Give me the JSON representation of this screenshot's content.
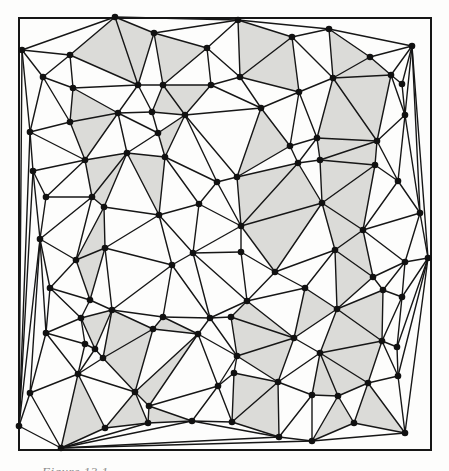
{
  "figure": {
    "caption": "Figure 13.1",
    "colors": {
      "background": "#fdfdfc",
      "line": "#161616",
      "dot": "#111111",
      "shade": "#dbdbd8",
      "frame": "#161616"
    },
    "frame": {
      "x": 19,
      "y": 18,
      "width": 412,
      "height": 432
    },
    "dot_radius": 3.3,
    "line_width": 1.4,
    "frame_width": 2,
    "points": [
      [
        115,
        17
      ],
      [
        238,
        20
      ],
      [
        329,
        29
      ],
      [
        412,
        46
      ],
      [
        292,
        37
      ],
      [
        154,
        33
      ],
      [
        207,
        48
      ],
      [
        22,
        50
      ],
      [
        70,
        55
      ],
      [
        370,
        57
      ],
      [
        391,
        75
      ],
      [
        402,
        84
      ],
      [
        43,
        77
      ],
      [
        73,
        88
      ],
      [
        138,
        85
      ],
      [
        163,
        85
      ],
      [
        211,
        85
      ],
      [
        240,
        77
      ],
      [
        299,
        92
      ],
      [
        333,
        78
      ],
      [
        405,
        115
      ],
      [
        118,
        113
      ],
      [
        185,
        115
      ],
      [
        152,
        112
      ],
      [
        70,
        122
      ],
      [
        127,
        153
      ],
      [
        317,
        138
      ],
      [
        377,
        141
      ],
      [
        30,
        132
      ],
      [
        33,
        171
      ],
      [
        85,
        160
      ],
      [
        165,
        157
      ],
      [
        375,
        165
      ],
      [
        320,
        160
      ],
      [
        46,
        197
      ],
      [
        92,
        197
      ],
      [
        104,
        207
      ],
      [
        217,
        182
      ],
      [
        237,
        177
      ],
      [
        298,
        163
      ],
      [
        398,
        181
      ],
      [
        322,
        203
      ],
      [
        420,
        213
      ],
      [
        199,
        204
      ],
      [
        159,
        215
      ],
      [
        40,
        239
      ],
      [
        105,
        248
      ],
      [
        76,
        260
      ],
      [
        193,
        253
      ],
      [
        241,
        226
      ],
      [
        363,
        230
      ],
      [
        335,
        250
      ],
      [
        405,
        262
      ],
      [
        428,
        258
      ],
      [
        172,
        265
      ],
      [
        241,
        252
      ],
      [
        275,
        272
      ],
      [
        50,
        288
      ],
      [
        90,
        300
      ],
      [
        305,
        288
      ],
      [
        373,
        277
      ],
      [
        383,
        290
      ],
      [
        402,
        297
      ],
      [
        81,
        318
      ],
      [
        112,
        310
      ],
      [
        46,
        333
      ],
      [
        85,
        344
      ],
      [
        95,
        349
      ],
      [
        103,
        358
      ],
      [
        78,
        374
      ],
      [
        30,
        393
      ],
      [
        153,
        329
      ],
      [
        163,
        317
      ],
      [
        135,
        392
      ],
      [
        149,
        406
      ],
      [
        148,
        423
      ],
      [
        19,
        426
      ],
      [
        61,
        448
      ],
      [
        105,
        428
      ],
      [
        192,
        421
      ],
      [
        210,
        318
      ],
      [
        231,
        317
      ],
      [
        198,
        334
      ],
      [
        237,
        356
      ],
      [
        234,
        373
      ],
      [
        218,
        386
      ],
      [
        232,
        422
      ],
      [
        247,
        301
      ],
      [
        278,
        382
      ],
      [
        294,
        338
      ],
      [
        279,
        437
      ],
      [
        312,
        441
      ],
      [
        337,
        309
      ],
      [
        382,
        341
      ],
      [
        397,
        347
      ],
      [
        320,
        353
      ],
      [
        398,
        376
      ],
      [
        368,
        383
      ],
      [
        338,
        396
      ],
      [
        312,
        395
      ],
      [
        354,
        423
      ],
      [
        405,
        433
      ],
      [
        158,
        133
      ],
      [
        261,
        108
      ],
      [
        290,
        146
      ]
    ],
    "shaded_regions": [
      [
        108,
        50
      ],
      [
        136,
        45
      ],
      [
        87,
        108
      ],
      [
        105,
        129
      ],
      [
        175,
        55
      ],
      [
        257,
        45
      ],
      [
        264,
        74
      ],
      [
        186,
        95
      ],
      [
        167,
        104
      ],
      [
        171,
        134
      ],
      [
        265,
        130
      ],
      [
        344,
        55
      ],
      [
        365,
        70
      ],
      [
        367,
        98
      ],
      [
        342,
        119
      ],
      [
        350,
        150
      ],
      [
        337,
        155
      ],
      [
        102,
        171
      ],
      [
        109,
        186
      ],
      [
        100,
        220
      ],
      [
        92,
        270
      ],
      [
        258,
        189
      ],
      [
        270,
        200
      ],
      [
        272,
        250
      ],
      [
        152,
        192
      ],
      [
        339,
        176
      ],
      [
        353,
        199
      ],
      [
        340,
        228
      ],
      [
        357,
        252
      ],
      [
        350,
        278
      ],
      [
        93,
        324
      ],
      [
        100,
        337
      ],
      [
        124,
        332
      ],
      [
        131,
        360
      ],
      [
        143,
        412
      ],
      [
        171,
        327
      ],
      [
        180,
        360
      ],
      [
        267,
        318
      ],
      [
        254,
        337
      ],
      [
        270,
        359
      ],
      [
        255,
        390
      ],
      [
        263,
        414
      ],
      [
        346,
        334
      ],
      [
        367,
        313
      ],
      [
        322,
        318
      ],
      [
        357,
        359
      ],
      [
        342,
        377
      ],
      [
        323,
        381
      ],
      [
        335,
        405
      ],
      [
        326,
        420
      ],
      [
        85,
        420
      ],
      [
        163,
        417
      ],
      [
        380,
        410
      ]
    ]
  }
}
